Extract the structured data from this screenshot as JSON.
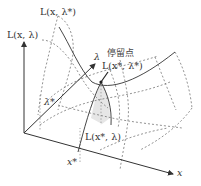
{
  "figure": {
    "labels": {
      "curve_x_lambda_star": "L(x, λ*)",
      "z_axis": "L(x, λ)",
      "saddle_cn": "停留点",
      "saddle_point": "L(x*, λ*)",
      "curve_x_star_lambda": "L(x*, λ)",
      "lambda_axis": "λ",
      "lambda_star": "λ*",
      "x_star": "x*",
      "x_axis": "x"
    },
    "colors": {
      "line": "#333333",
      "dashed": "#777777",
      "shade": "#e6e6e6",
      "background": "#ffffff"
    }
  }
}
